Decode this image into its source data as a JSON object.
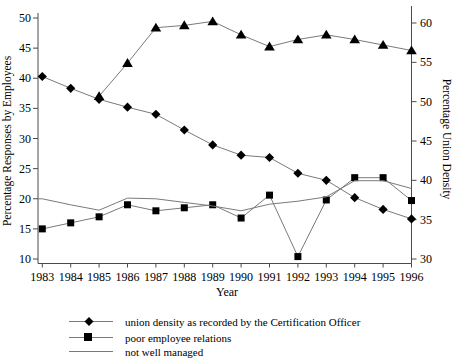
{
  "figure": {
    "background": "#ffffff",
    "axis_color": "#4a4a4a",
    "series_line_color": "#7a7a7a",
    "marker_color": "#000000",
    "text_color": "#000000"
  },
  "chart_data": {
    "type": "line",
    "x": [
      1983,
      1984,
      1985,
      1986,
      1987,
      1988,
      1989,
      1990,
      1991,
      1992,
      1993,
      1994,
      1995,
      1996
    ],
    "xlabel": "Year",
    "left_axis": {
      "label": "Percentage Responses by Employees",
      "ticks": [
        10,
        15,
        20,
        25,
        30,
        35,
        40,
        45,
        50
      ],
      "range": [
        10,
        50
      ]
    },
    "right_axis": {
      "label": "Percentage Union Density",
      "ticks": [
        30,
        35,
        40,
        45,
        50,
        55,
        60
      ],
      "range": [
        30,
        60
      ]
    },
    "series": [
      {
        "id": "union-density",
        "name": "union density as recorded by the Certification Officer",
        "marker": "diamond",
        "axis": "right",
        "values": [
          53.2,
          51.7,
          50.3,
          49.3,
          48.4,
          46.4,
          44.5,
          43.2,
          42.9,
          40.9,
          40.0,
          37.8,
          36.3,
          35.1
        ]
      },
      {
        "id": "poor-employee-relations",
        "name": "poor employee relations",
        "marker": "square",
        "axis": "left",
        "values": [
          15,
          16,
          17,
          19,
          18,
          18.5,
          19,
          16.8,
          20.6,
          10.4,
          19.8,
          23.5,
          23.5,
          19.7
        ]
      },
      {
        "id": "not-well-managed",
        "name": "not well managed",
        "marker": "none",
        "axis": "left",
        "values": [
          20,
          19,
          18.1,
          20.1,
          20,
          19.4,
          18.8,
          18,
          19.1,
          19.6,
          20.3,
          23,
          23,
          21.7
        ]
      },
      {
        "id": "triangle-series",
        "name": "",
        "marker": "triangle",
        "axis": "right",
        "values": [
          null,
          null,
          50.7,
          54.9,
          59.4,
          59.7,
          60.2,
          58.5,
          57.0,
          57.9,
          58.5,
          57.9,
          57.2,
          56.5
        ]
      }
    ],
    "legend": [
      {
        "label": "union density as recorded by the Certification Officer",
        "marker": "diamond"
      },
      {
        "label": "poor employee relations",
        "marker": "square"
      },
      {
        "label": "not well managed",
        "marker": "line"
      }
    ],
    "legend_position": "below-left",
    "grid": false
  }
}
